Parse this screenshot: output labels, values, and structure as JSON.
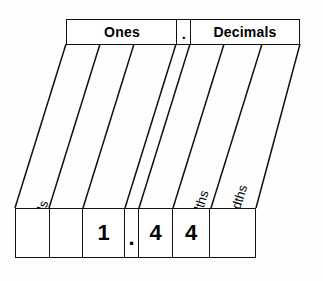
{
  "diagram": {
    "header": {
      "ones_label": "Ones",
      "point_label": ".",
      "decimals_label": "Decimals"
    },
    "columns": [
      {
        "name": "hundreds",
        "label": "hundreds",
        "digit": ""
      },
      {
        "name": "tens",
        "label": "tens",
        "digit": ""
      },
      {
        "name": "ones",
        "label": "ones",
        "digit": "1"
      },
      {
        "name": "decimal-point",
        "label": "",
        "digit": "."
      },
      {
        "name": "tenths",
        "label": "tenths",
        "digit": "4"
      },
      {
        "name": "hundredths",
        "label": "hundredths",
        "digit": "4"
      },
      {
        "name": "thousandths",
        "label": "thousandths",
        "digit": ""
      }
    ],
    "value_shown": "1.44",
    "colors": {
      "line": "#111111",
      "background": "#fefefe",
      "text": "#000000"
    }
  }
}
